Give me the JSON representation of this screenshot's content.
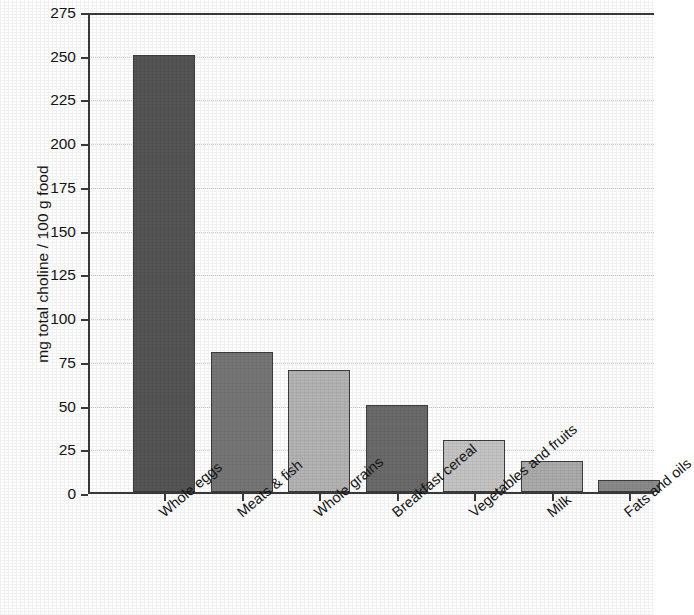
{
  "chart_data": {
    "type": "bar",
    "title": "",
    "xlabel": "",
    "ylabel": "mg total choline / 100 g food",
    "categories": [
      "Whole eggs",
      "Meats & fish",
      "Whole grains",
      "Breakfast cereal",
      "Vegetables and fruits",
      "Milk",
      "Fats and oils"
    ],
    "values": [
      250,
      80,
      70,
      50,
      30,
      18,
      7
    ],
    "bar_colors": [
      "#555555",
      "#767676",
      "#b3b3b3",
      "#6a6a6a",
      "#c4c4c4",
      "#ababab",
      "#8a8a8a"
    ],
    "ylim": [
      0,
      275
    ],
    "ytick_values": [
      0,
      25,
      50,
      75,
      100,
      125,
      150,
      175,
      200,
      225,
      250,
      275
    ],
    "ytick_labels": [
      "0",
      "25",
      "50",
      "75",
      "100",
      "125",
      "150",
      "175",
      "200",
      "225",
      "250",
      "275"
    ],
    "grid": true,
    "grid_axis": "y",
    "grid_style": "dotted",
    "grid_color": "#c9c9c9",
    "legend": "none",
    "xlabel_rotation": -40,
    "axis_color": "#3a3a3a",
    "background_color": "#ffffff"
  }
}
